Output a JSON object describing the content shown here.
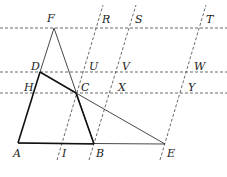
{
  "figure": {
    "type": "geometry-diagram",
    "width": 227,
    "height": 177,
    "points": {
      "A": {
        "label": "A",
        "x": 18,
        "y": 143,
        "lx": 13,
        "ly": 157
      },
      "B": {
        "label": "B",
        "x": 94,
        "y": 144,
        "lx": 96,
        "ly": 157
      },
      "E": {
        "label": "E",
        "x": 165,
        "y": 144,
        "lx": 167,
        "ly": 157
      },
      "I": {
        "label": "I",
        "x": 61,
        "y": 144,
        "lx": 62,
        "ly": 157
      },
      "F": {
        "label": "F",
        "x": 54,
        "y": 28,
        "lx": 47,
        "ly": 22
      },
      "D": {
        "label": "D",
        "x": 40,
        "y": 72,
        "lx": 31,
        "ly": 70
      },
      "H": {
        "label": "H",
        "x": 36,
        "y": 93,
        "lx": 24,
        "ly": 91
      },
      "C": {
        "label": "C",
        "x": 76,
        "y": 93,
        "lx": 81,
        "ly": 91
      },
      "U": {
        "label": "U",
        "x": 83,
        "y": 72,
        "lx": 89,
        "ly": 70
      },
      "R": {
        "label": "R",
        "x": 97,
        "y": 28,
        "lx": 102,
        "ly": 23
      },
      "V": {
        "label": "V",
        "x": 115,
        "y": 72,
        "lx": 122,
        "ly": 70
      },
      "X": {
        "label": "X",
        "x": 109,
        "y": 93,
        "lx": 118,
        "ly": 91
      },
      "S": {
        "label": "S",
        "x": 128,
        "y": 28,
        "lx": 135,
        "ly": 23
      },
      "W": {
        "label": "W",
        "x": 186,
        "y": 72,
        "lx": 194,
        "ly": 70
      },
      "Y": {
        "label": "Y",
        "x": 180,
        "y": 93,
        "lx": 188,
        "ly": 91
      },
      "T": {
        "label": "T",
        "x": 199,
        "y": 28,
        "lx": 206,
        "ly": 23
      }
    },
    "horizontal_dashed_lines": [
      {
        "name": "line-FRST",
        "y": 28,
        "x1": 0,
        "x2": 227
      },
      {
        "name": "line-DUVW",
        "y": 72,
        "x1": 0,
        "x2": 227
      },
      {
        "name": "line-HCXY",
        "y": 93,
        "x1": 0,
        "x2": 227
      }
    ],
    "slanted_dashed_lines": [
      {
        "name": "line-IUR",
        "x1": 57,
        "y1": 160,
        "x2": 103,
        "y2": 5
      },
      {
        "name": "line-BXVS",
        "x1": 89,
        "y1": 160,
        "x2": 136,
        "y2": 5
      },
      {
        "name": "line-EYWT",
        "x1": 160,
        "y1": 160,
        "x2": 206,
        "y2": 5
      }
    ],
    "colors": {
      "stroke": "#111111",
      "dash": "#444444",
      "label": "#222222",
      "background": "#ffffff"
    }
  }
}
